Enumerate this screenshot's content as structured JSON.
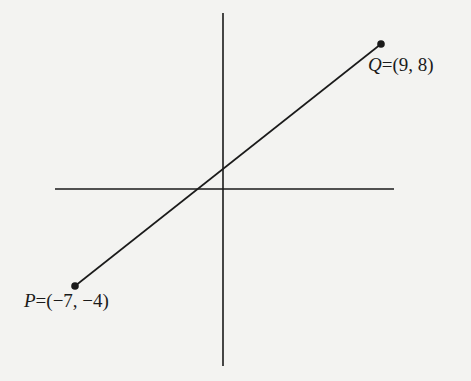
{
  "diagram": {
    "type": "coordinate-plane-segment",
    "axes": {
      "x_axis": {
        "x1": 55,
        "x2": 394,
        "y": 189
      },
      "y_axis": {
        "x": 223,
        "y1": 13,
        "y2": 366
      }
    },
    "segment": {
      "from": "P",
      "to": "Q"
    },
    "points": {
      "P": {
        "name": "P",
        "coords_text": "=(−7, −4)",
        "x": -7,
        "y": -4,
        "px": 75,
        "py": 286
      },
      "Q": {
        "name": "Q",
        "coords_text": "=(9, 8)",
        "x": 9,
        "y": 8,
        "px": 381,
        "py": 44
      }
    },
    "colors": {
      "background": "#f3f3f1",
      "ink": "#1a1a1a"
    }
  }
}
